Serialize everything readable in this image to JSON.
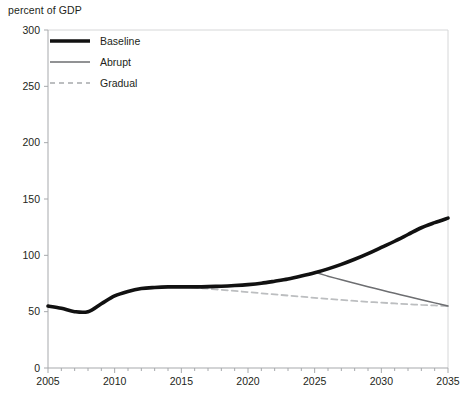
{
  "chart_data": {
    "type": "line",
    "title": "",
    "subtitle": "",
    "ylabel": "percent of GDP",
    "xlabel": "",
    "xlim": [
      2005,
      2035
    ],
    "ylim": [
      0,
      300
    ],
    "grid": false,
    "legend_position": "top-left",
    "x_ticks": [
      "2005",
      "2010",
      "2015",
      "2020",
      "2025",
      "2030",
      "2035"
    ],
    "x_tick_values": [
      2005,
      2010,
      2015,
      2020,
      2025,
      2030,
      2035
    ],
    "x_minor_tick_step": 1,
    "y_ticks": [
      "0",
      "50",
      "100",
      "150",
      "200",
      "250",
      "300"
    ],
    "y_tick_values": [
      0,
      50,
      100,
      150,
      200,
      250,
      300
    ],
    "series": [
      {
        "name": "Baseline",
        "color": "#111111",
        "style": "solid",
        "width": 3.6,
        "x": [
          2005,
          2006,
          2007,
          2008,
          2009,
          2010,
          2011,
          2012,
          2013,
          2014,
          2015,
          2016,
          2017,
          2018,
          2019,
          2020,
          2021,
          2022,
          2023,
          2024,
          2025,
          2026,
          2027,
          2028,
          2029,
          2030,
          2031,
          2032,
          2033,
          2034,
          2035
        ],
        "values": [
          55,
          53,
          50,
          50,
          57,
          64,
          68,
          70.5,
          71.5,
          72,
          72,
          72,
          72.2,
          72.6,
          73.2,
          74,
          75.2,
          77,
          79,
          81.6,
          84.5,
          88,
          92,
          96.5,
          101.5,
          107,
          112.5,
          118.5,
          124.5,
          129,
          133
        ]
      },
      {
        "name": "Abrupt",
        "color": "#6d6e71",
        "style": "solid",
        "width": 1.5,
        "x": [
          2005,
          2006,
          2007,
          2008,
          2009,
          2010,
          2011,
          2012,
          2013,
          2014,
          2015,
          2016,
          2017,
          2018,
          2019,
          2020,
          2021,
          2022,
          2023,
          2024,
          2025,
          2026,
          2027,
          2028,
          2029,
          2030,
          2031,
          2032,
          2033,
          2034,
          2035
        ],
        "values": [
          55,
          53,
          50,
          50,
          57,
          64,
          68,
          70.5,
          71.5,
          72,
          72,
          72,
          72.2,
          72.6,
          73.2,
          74,
          75.2,
          77,
          79,
          81.6,
          84.5,
          81.5,
          78.3,
          75.2,
          72.2,
          69.2,
          66.3,
          63.4,
          60.6,
          57.8,
          55
        ]
      },
      {
        "name": "Gradual",
        "color": "#bcbec0",
        "style": "dashed",
        "width": 1.8,
        "x": [
          2005,
          2006,
          2007,
          2008,
          2009,
          2010,
          2011,
          2012,
          2013,
          2014,
          2015,
          2016,
          2017,
          2018,
          2019,
          2020,
          2021,
          2022,
          2023,
          2024,
          2025,
          2026,
          2027,
          2028,
          2029,
          2030,
          2031,
          2032,
          2033,
          2034,
          2035
        ],
        "values": [
          55,
          53,
          50,
          50,
          57,
          64,
          68,
          70.5,
          71.5,
          72,
          72,
          71.3,
          70.4,
          69.4,
          68.4,
          67.4,
          66.3,
          65.3,
          64.3,
          63.3,
          62.3,
          61.3,
          60.4,
          59.5,
          58.7,
          58,
          57.3,
          56.6,
          56,
          55.5,
          55
        ]
      }
    ],
    "annotations": []
  },
  "legend": {
    "items": [
      {
        "label": "Baseline"
      },
      {
        "label": "Abrupt"
      },
      {
        "label": "Gradual"
      }
    ]
  },
  "colors": {
    "baseline": "#111111",
    "abrupt": "#6d6e71",
    "gradual": "#bcbec0",
    "axis": "#a7a9ac",
    "text": "#231f20"
  }
}
